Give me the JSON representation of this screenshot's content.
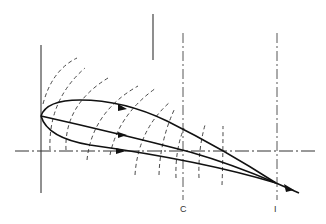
{
  "figure": {
    "labels": {
      "chord_station_c": "C",
      "chord_station_i": "I"
    },
    "caption_partial": "",
    "colors": {
      "stroke": "#111111",
      "dashed": "#333333",
      "background": "#ffffff"
    },
    "elements": {
      "airfoil_upper_surface": "solid curve from leading edge to trailing edge with arrow",
      "mean_streamline": "solid line from leading edge to trailing edge with arrow",
      "airfoil_lower_surface": "solid curve from leading edge to trailing edge with arrow",
      "centerline": "horizontal dash-dot axis",
      "leading_edge_axis": "vertical solid line",
      "flow_direction_indicator": "short vertical line above",
      "wavefront_arcs": 8
    }
  }
}
